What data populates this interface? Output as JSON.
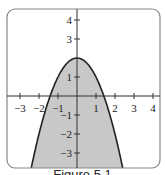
{
  "chart_data": {
    "type": "area",
    "title": "",
    "function": "y = 2 - x^2",
    "xlabel": "",
    "ylabel": "",
    "xlim": [
      -3.7,
      4.4
    ],
    "ylim": [
      -3.8,
      4.6
    ],
    "x_ticks": [
      -3,
      -2,
      -1,
      1,
      2,
      3,
      4
    ],
    "y_ticks": [
      4,
      3,
      1,
      -1,
      -2,
      -3
    ],
    "x_tick_labels": [
      "−3",
      "−2",
      "−1",
      "1",
      "2",
      "3",
      "4"
    ],
    "y_tick_labels": [
      "4",
      "3",
      "1",
      "−1",
      "−2",
      "−3"
    ],
    "shaded_region": "below parabola y = 2 - x^2",
    "grid": false,
    "legend": null,
    "colors": {
      "fill": "#c8c8c8",
      "curve": "#222222",
      "frame": "#888888"
    }
  },
  "caption": "Figure 5.1"
}
